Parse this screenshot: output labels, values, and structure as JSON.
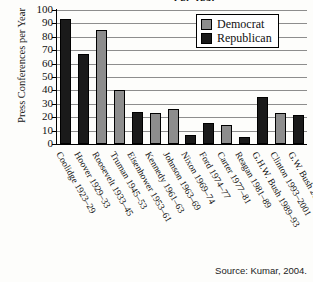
{
  "chart_data": {
    "type": "bar",
    "title": "Per Year",
    "xlabel": "",
    "ylabel": "Press Conferences per Year",
    "ylim": [
      0,
      100
    ],
    "ytick_step": 10,
    "yticks": [
      0,
      10,
      20,
      30,
      40,
      50,
      60,
      70,
      80,
      90,
      100
    ],
    "grid": true,
    "legend_position": "top-right",
    "categories": [
      "Coolidge 1923–29",
      "Hoover 1929–33",
      "Roosevelt 1933–45",
      "Truman 1945–53",
      "Eisenhower 1953–61",
      "Kennedy 1961–63",
      "Johnson 1963–69",
      "Nixon 1969–74",
      "Ford 1974–77",
      "Carter 1977–81",
      "Reagan 1981–89",
      "G.H.W. Bush 1989–93",
      "Clinton 1993–2001",
      "G.W. Bush 2001–04"
    ],
    "values": [
      93,
      67,
      85,
      40,
      24,
      23,
      26,
      7,
      16,
      14,
      5,
      35,
      23,
      22
    ],
    "parties": [
      "Republican",
      "Republican",
      "Democrat",
      "Democrat",
      "Republican",
      "Democrat",
      "Democrat",
      "Republican",
      "Republican",
      "Democrat",
      "Republican",
      "Republican",
      "Democrat",
      "Republican"
    ],
    "legend": [
      {
        "label": "Democrat",
        "color": "#8d8d8d"
      },
      {
        "label": "Republican",
        "color": "#1a1a1a"
      }
    ],
    "colors": {
      "democrat": "#8d8d8d",
      "republican": "#1a1a1a",
      "axis": "#000000",
      "grid": "#8d8d8d"
    }
  },
  "source_note": "Source: Kumar, 2004."
}
